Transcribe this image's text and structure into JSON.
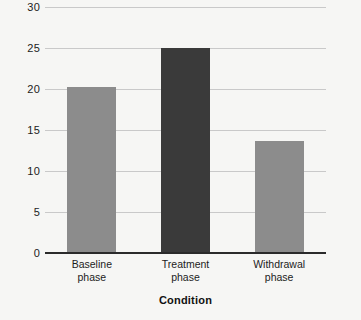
{
  "chart_data": {
    "type": "bar",
    "title": "",
    "subtitle": "",
    "xlabel": "Condition",
    "ylabel": "",
    "categories": [
      "Baseline phase",
      "Treatment phase",
      "Withdrawal phase"
    ],
    "category_lines": [
      [
        "Baseline",
        "phase"
      ],
      [
        "Treatment",
        "phase"
      ],
      [
        "Withdrawal",
        "phase"
      ]
    ],
    "values": [
      20.2,
      25.0,
      13.6
    ],
    "bar_colors": [
      "#8c8c8c",
      "#3a3a3a",
      "#8c8c8c"
    ],
    "ylim": [
      0,
      30
    ],
    "yticks": [
      0,
      5,
      10,
      15,
      20,
      25,
      30
    ],
    "ytick_labels": [
      "0",
      "5",
      "10",
      "15",
      "20",
      "25",
      "30"
    ],
    "grid": true,
    "grid_axis": "y",
    "legend": false,
    "legend_position": "none"
  },
  "style": {
    "background": "#f6f6f4",
    "gridline_color": "#c9c9c9",
    "axis_color": "#2b2b2b",
    "text_color": "#1c1c1c"
  }
}
